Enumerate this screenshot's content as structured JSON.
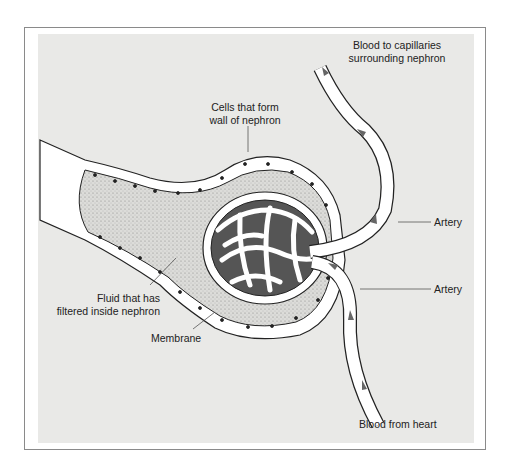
{
  "diagram": {
    "labels": {
      "blood_to_capillaries": [
        "Blood to capillaries",
        "surrounding nephron"
      ],
      "cells_wall": [
        "Cells that form",
        "wall of nephron"
      ],
      "artery_upper": "Artery",
      "artery_lower": "Artery",
      "fluid": [
        "Fluid that has",
        "filtered inside nephron"
      ],
      "membrane": "Membrane",
      "blood_from_heart": "Blood from heart"
    },
    "colors": {
      "panel_bg": "#e9e9e7",
      "vessel_fill": "#ffffff",
      "capillary_dark": "#555555",
      "outline": "#222222",
      "arrow": "#666666",
      "stipple": "#bdbdbd"
    }
  }
}
